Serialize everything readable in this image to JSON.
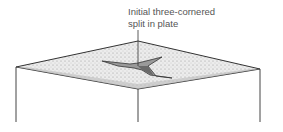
{
  "annotation": {
    "line1": "Initial three-cornered",
    "line2": "split in plate"
  },
  "colors": {
    "plate_fill": "#e4e4e4",
    "stroke": "#333333",
    "split_fill": "#9a9a9a",
    "split_dark": "#6a6a6a"
  }
}
